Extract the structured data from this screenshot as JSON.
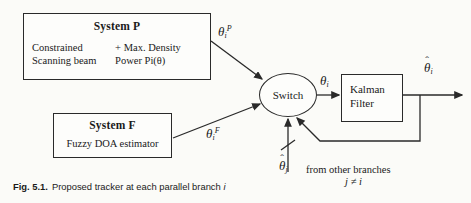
{
  "figure": {
    "caption_number": "Fig. 5.1.",
    "caption_text": "Proposed tracker at each parallel branch",
    "caption_italic_symbol": "i"
  },
  "blocks": {
    "system_p": {
      "title": "System P",
      "left_line1": "Constrained",
      "left_line2": "Scanning beam",
      "right_line1": "+ Max. Density",
      "right_line2": "Power Pi(θ)"
    },
    "system_f": {
      "title": "System F",
      "subtitle": "Fuzzy DOA estimator"
    },
    "kalman": {
      "line1": "Kalman",
      "line2": "Filter"
    },
    "switch": {
      "label": "Switch"
    }
  },
  "signals": {
    "theta_p": {
      "base": "θ",
      "sub": "i",
      "sup": "P"
    },
    "theta_f": {
      "base": "θ",
      "sub": "i",
      "sup": "F"
    },
    "theta_i": {
      "base": "θ",
      "sub": "i",
      "sup": ""
    },
    "theta_hat_out": {
      "hat": "ˆ",
      "base": "θ",
      "sub": "i"
    },
    "theta_hat_j": {
      "hat": "ˆ",
      "base": "θ",
      "sub": "j"
    },
    "other_branches": "from other branches",
    "index_condition": "j ≠ i"
  },
  "colors": {
    "ink": "#2a2a2a",
    "paper": "#fbfbf8",
    "box_fill": "#fdfdfb"
  }
}
